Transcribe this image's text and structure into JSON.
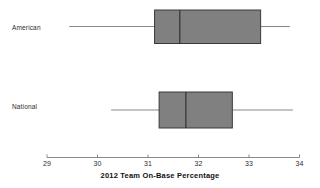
{
  "chart_data": {
    "type": "box",
    "title": "",
    "xlabel": "2012 Team On-Base Percentage",
    "ylabel": "",
    "orientation": "horizontal",
    "xlim": [
      28.7,
      34.3
    ],
    "xticks": [
      29,
      30,
      31,
      32,
      33,
      34
    ],
    "xtick_labels": [
      "29",
      "30",
      "31",
      "32",
      "33",
      "34"
    ],
    "grid": false,
    "legend": "none",
    "categories": [
      "American",
      "National"
    ],
    "box_fill_color": "#808080",
    "box_edge_color": "#3a3a3a",
    "whisker_color": "#8a8a8a",
    "axis_color": "#8a8a8a",
    "boxes": [
      {
        "label": "American",
        "min": 29.44,
        "q1": 31.13,
        "median": 31.63,
        "q3": 33.23,
        "max": 33.81
      },
      {
        "label": "National",
        "min": 30.27,
        "q1": 31.22,
        "median": 31.75,
        "q3": 32.67,
        "max": 33.87
      }
    ]
  },
  "labels": {
    "american": "American",
    "national": "National",
    "axis_title": "2012 Team On-Base Percentage",
    "tick_29": "29",
    "tick_30": "30",
    "tick_31": "31",
    "tick_32": "32",
    "tick_33": "33",
    "tick_34": "34"
  }
}
